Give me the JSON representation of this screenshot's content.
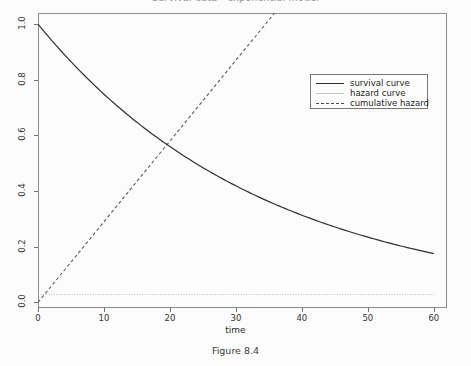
{
  "chart_data": {
    "type": "line",
    "title": "Survival data - exponential model",
    "caption": "Figure 8.4",
    "xlabel": "time",
    "ylabel": "",
    "xlim": [
      0,
      62
    ],
    "ylim": [
      -0.02,
      1.04
    ],
    "grid": false,
    "legend_position": "upper-right",
    "x_ticks": [
      "0",
      "10",
      "20",
      "30",
      "40",
      "50",
      "60"
    ],
    "x_tick_values": [
      0,
      10,
      20,
      30,
      40,
      50,
      60
    ],
    "y_ticks": [
      "0.0",
      "0.2",
      "0.4",
      "0.6",
      "0.8",
      "1.0"
    ],
    "y_tick_values": [
      0.0,
      0.2,
      0.4,
      0.6,
      0.8,
      1.0
    ],
    "hazard_rate": 0.029,
    "series": [
      {
        "name": "survival curve",
        "style": "solid",
        "color": "#2e2e2e",
        "formula": "S(t) = exp(-0.029 t)",
        "x": [
          0,
          5,
          10,
          15,
          20,
          25,
          30,
          35,
          40,
          45,
          50,
          55,
          60
        ],
        "values": [
          1.0,
          0.865,
          0.748,
          0.647,
          0.56,
          0.484,
          0.419,
          0.362,
          0.313,
          0.271,
          0.235,
          0.203,
          0.176
        ]
      },
      {
        "name": "hazard curve",
        "style": "dotted-flat",
        "color": "#b9b9b9",
        "formula": "h(t) = 0.029",
        "x": [
          0,
          10,
          20,
          30,
          40,
          50,
          60
        ],
        "values": [
          0.029,
          0.029,
          0.029,
          0.029,
          0.029,
          0.029,
          0.029
        ]
      },
      {
        "name": "cumulative hazard",
        "style": "dashed",
        "color": "#4a4a4a",
        "formula": "H(t) = 0.029 t",
        "x": [
          0,
          5,
          10,
          15,
          20,
          25,
          30,
          35,
          36
        ],
        "values": [
          0.0,
          0.145,
          0.29,
          0.435,
          0.58,
          0.725,
          0.87,
          1.015,
          1.044
        ]
      }
    ],
    "annotations": {
      "intersection_note": "survival and cumulative hazard cross near t = 19.5, value = 0.55"
    }
  },
  "legend": {
    "items": [
      {
        "label": "survival curve"
      },
      {
        "label": "hazard curve"
      },
      {
        "label": "cumulative hazard"
      }
    ]
  }
}
